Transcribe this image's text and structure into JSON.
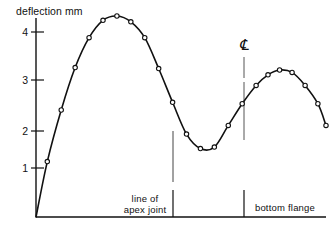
{
  "chart_data": {
    "type": "line",
    "title": "",
    "ylabel": "deflection mm",
    "xlabel": "",
    "ylim": [
      0,
      4.45
    ],
    "xlim": [
      0,
      100
    ],
    "grid": false,
    "legend": null,
    "y_ticks": [
      "1",
      "2",
      "3",
      "4"
    ],
    "y_tick_values": [
      1,
      2,
      3,
      4
    ],
    "markers": "open-circle",
    "series": [
      {
        "name": "deflection",
        "x": [
          0.0,
          3.5,
          9.5,
          15.5,
          21.5,
          27.0,
          32.5,
          38.0,
          43.5,
          49.0,
          54.5,
          60.0,
          65.5,
          71.0,
          76.5,
          82.0,
          87.5,
          93.0,
          98.5
        ],
        "values": [
          0.0,
          1.15,
          2.22,
          3.1,
          3.72,
          4.08,
          4.17,
          4.05,
          3.72,
          3.08,
          2.38,
          1.72,
          1.42,
          1.45,
          1.9,
          2.35,
          2.73,
          2.95,
          3.05
        ]
      }
    ],
    "points": [
      {
        "x": 0.0,
        "y": 0.0
      },
      {
        "x": 3.9,
        "y": 1.15
      },
      {
        "x": 8.7,
        "y": 2.22
      },
      {
        "x": 13.5,
        "y": 3.1
      },
      {
        "x": 18.3,
        "y": 3.72
      },
      {
        "x": 23.1,
        "y": 4.08
      },
      {
        "x": 27.9,
        "y": 4.17
      },
      {
        "x": 32.7,
        "y": 4.05
      },
      {
        "x": 37.5,
        "y": 3.72
      },
      {
        "x": 42.3,
        "y": 3.08
      },
      {
        "x": 47.1,
        "y": 2.38
      },
      {
        "x": 51.9,
        "y": 1.72
      },
      {
        "x": 56.7,
        "y": 1.42
      },
      {
        "x": 61.5,
        "y": 1.45
      },
      {
        "x": 66.3,
        "y": 1.9
      },
      {
        "x": 71.1,
        "y": 2.35
      },
      {
        "x": 75.9,
        "y": 2.73
      },
      {
        "x": 80.0,
        "y": 2.95
      },
      {
        "x": 84.0,
        "y": 3.05
      },
      {
        "x": 88.3,
        "y": 3.0
      },
      {
        "x": 92.8,
        "y": 2.73
      },
      {
        "x": 97.2,
        "y": 2.35
      },
      {
        "x": 100.0,
        "y": 1.9
      }
    ],
    "annotations": [
      {
        "name": "apex-joint-line",
        "label_line1": "line of",
        "label_line2": "apex joint",
        "x": 57.0
      },
      {
        "name": "centre-line",
        "label": "bottom flange",
        "symbol": "CL",
        "x": 84.0
      }
    ]
  },
  "labels": {
    "y_axis_title": "deflection mm",
    "tick_1": "1",
    "tick_2": "2",
    "tick_3": "3",
    "tick_4": "4",
    "apex_line_1": "line of",
    "apex_line_2": "apex joint",
    "bottom_flange": "bottom flange",
    "centreline_symbol": "℄"
  },
  "colors": {
    "ink": "#111111",
    "divider": "#555555",
    "background": "#ffffff"
  }
}
